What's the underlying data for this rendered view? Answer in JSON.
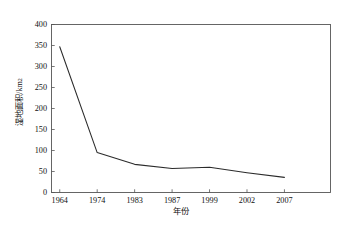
{
  "chart_data": {
    "type": "line",
    "title": "",
    "xlabel": "年份",
    "ylabel": "湿地面积/km²",
    "ylabel_base": "湿地面积/km",
    "ylabel_sup": "2",
    "categories": [
      "1964",
      "1974",
      "1983",
      "1987",
      "1999",
      "2002",
      "2007"
    ],
    "series": [
      {
        "name": "湿地面积",
        "values": [
          347,
          95,
          67,
          57,
          60,
          47,
          36
        ]
      }
    ],
    "values": [
      347,
      95,
      67,
      57,
      60,
      47,
      36
    ],
    "yticks": [
      0,
      50,
      100,
      150,
      200,
      250,
      300,
      350,
      400
    ],
    "ytick_labels": [
      "0",
      "50",
      "100",
      "150",
      "200",
      "250",
      "300",
      "350",
      "400"
    ],
    "ylim": [
      0,
      400
    ],
    "grid": false,
    "legend": false,
    "legend_position": "none",
    "line_color": "#2b2b2b",
    "axis_color": "#555555",
    "text_color": "#111111",
    "background": "#ffffff"
  }
}
